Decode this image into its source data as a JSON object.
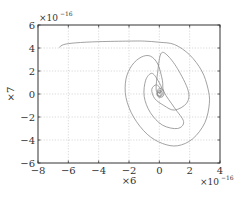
{
  "chart_data": {
    "type": "line",
    "title": "",
    "xlabel": "×6",
    "ylabel": "×7",
    "x_exponent_label": "×10^-16",
    "y_exponent_label": "×10^-16",
    "xlim": [
      -8,
      4
    ],
    "ylim": [
      -6,
      6
    ],
    "xticks": [
      -8,
      -6,
      -4,
      -2,
      0,
      2,
      4
    ],
    "yticks": [
      -6,
      -4,
      -2,
      0,
      2,
      4,
      6
    ],
    "xtick_labels": [
      "−8",
      "−6",
      "−4",
      "−2",
      "0",
      "2",
      "4"
    ],
    "ytick_labels": [
      "−6",
      "−4",
      "−2",
      "0",
      "2",
      "4",
      "6"
    ],
    "grid": true,
    "legend": null,
    "series": [
      {
        "name": "trajectory (x6 vs x7, phase plot spiraling to origin)",
        "color": "#8a8a8a",
        "points": [
          [
            -6.6,
            4.05
          ],
          [
            -6.3,
            4.3
          ],
          [
            -5.5,
            4.45
          ],
          [
            -4,
            4.55
          ],
          [
            -2,
            4.6
          ],
          [
            -1,
            4.6
          ],
          [
            0,
            4.5
          ],
          [
            1,
            4.3
          ],
          [
            2,
            3.4
          ],
          [
            2.8,
            2.0
          ],
          [
            3.2,
            0.5
          ],
          [
            3.3,
            -0.8
          ],
          [
            3.0,
            -2.5
          ],
          [
            2.2,
            -3.9
          ],
          [
            1.2,
            -4.5
          ],
          [
            0.2,
            -4.3
          ],
          [
            -0.8,
            -3.5
          ],
          [
            -1.7,
            -2.0
          ],
          [
            -2.2,
            -0.3
          ],
          [
            -2.2,
            1.3
          ],
          [
            -1.8,
            2.5
          ],
          [
            -1.2,
            3.2
          ],
          [
            -0.6,
            3.3
          ],
          [
            -0.1,
            2.6
          ],
          [
            0.2,
            1.2
          ],
          [
            0.3,
            0.2
          ],
          [
            1.0,
            -1.2
          ],
          [
            1.6,
            -2.4
          ],
          [
            1.2,
            -3.0
          ],
          [
            0.2,
            -2.7
          ],
          [
            -0.6,
            -1.6
          ],
          [
            -1.0,
            -0.2
          ],
          [
            -0.9,
            1.2
          ],
          [
            -0.5,
            1.8
          ],
          [
            -0.1,
            1.2
          ],
          [
            0.2,
            0.3
          ],
          [
            -0.2,
            0.3
          ],
          [
            -0.1,
            2.0
          ],
          [
            0.1,
            3.5
          ],
          [
            0.5,
            3.4
          ],
          [
            1.2,
            2.2
          ],
          [
            1.9,
            0.3
          ],
          [
            1.8,
            -0.8
          ],
          [
            1.0,
            -1.4
          ],
          [
            0.3,
            -1.0
          ],
          [
            -0.3,
            -0.4
          ],
          [
            -0.5,
            0.4
          ],
          [
            -0.2,
            0.8
          ],
          [
            0.1,
            0.4
          ],
          [
            0.0,
            0.0
          ]
        ]
      }
    ]
  }
}
